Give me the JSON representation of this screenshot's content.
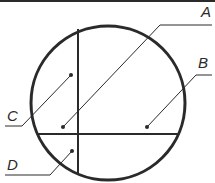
{
  "diagram": {
    "colors": {
      "stroke": "#2a2a2a",
      "background": "#ffffff"
    },
    "top_border": {
      "x1": 0,
      "y1": 1,
      "x2": 215,
      "y2": 1,
      "width": 2
    },
    "circle": {
      "cx": 108,
      "cy": 103,
      "r": 77,
      "stroke_width": 3
    },
    "vertical_chord": {
      "x": 78,
      "y1": 29,
      "y2": 174
    },
    "horizontal_chord": {
      "y": 134,
      "x1": 38,
      "x2": 179
    },
    "labels": [
      {
        "id": "A",
        "text": "A",
        "x": 201,
        "y": 4,
        "leader": [
          [
            212,
            25
          ],
          [
            160,
            25
          ],
          [
            63,
            127
          ]
        ],
        "dot": [
          63,
          127
        ]
      },
      {
        "id": "B",
        "text": "B",
        "x": 198,
        "y": 55,
        "leader": [
          [
            212,
            75
          ],
          [
            196,
            75
          ],
          [
            147,
            127
          ]
        ],
        "dot": [
          147,
          127
        ]
      },
      {
        "id": "C",
        "text": "C",
        "x": 7,
        "y": 108,
        "leader": [
          [
            5,
            126
          ],
          [
            22,
            126
          ],
          [
            71,
            75
          ]
        ],
        "dot": [
          71,
          75
        ]
      },
      {
        "id": "D",
        "text": "D",
        "x": 7,
        "y": 157,
        "leader": [
          [
            5,
            175
          ],
          [
            50,
            175
          ],
          [
            72,
            151
          ]
        ],
        "dot": [
          72,
          151
        ]
      }
    ]
  }
}
